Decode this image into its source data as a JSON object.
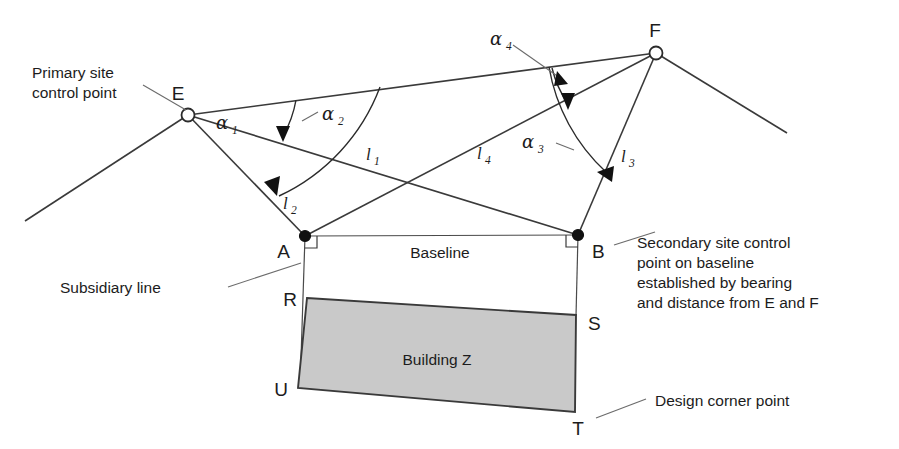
{
  "figure": {
    "colors": {
      "line": "#3a3a3a",
      "building_fill": "#c9c9c9",
      "building_stroke": "#3a3a3a",
      "text": "#1c1c1c",
      "background": "#ffffff"
    }
  },
  "annotations": {
    "primary_control": {
      "line1": "Primary site",
      "line2": "control point"
    },
    "secondary_control": {
      "line1": "Secondary site control",
      "line2": "point on baseline",
      "line3": "established by bearing",
      "line4": "and distance from E and F"
    },
    "subsidiary_line": "Subsidiary line",
    "design_corner": "Design corner point",
    "baseline": "Baseline",
    "building": "Building Z"
  },
  "points": {
    "E": {
      "label": "E",
      "x": 188,
      "y": 115,
      "type": "primary-control-point"
    },
    "F": {
      "label": "F",
      "x": 656,
      "y": 53,
      "type": "primary-control-point"
    },
    "A": {
      "label": "A",
      "x": 305,
      "y": 236,
      "type": "secondary-control-point"
    },
    "B": {
      "label": "B",
      "x": 578,
      "y": 235,
      "type": "secondary-control-point"
    },
    "R": {
      "label": "R",
      "x": 307,
      "y": 298,
      "type": "design-corner-point"
    },
    "S": {
      "label": "S",
      "x": 576,
      "y": 315,
      "type": "design-corner-point"
    },
    "T": {
      "label": "T",
      "x": 575,
      "y": 412,
      "type": "design-corner-point"
    },
    "U": {
      "label": "U",
      "x": 298,
      "y": 388,
      "type": "design-corner-point"
    }
  },
  "angles": {
    "a1": {
      "label": "α",
      "sub": "1",
      "at": "E",
      "from": "E-F",
      "to": "l1"
    },
    "a2": {
      "label": "α",
      "sub": "2",
      "at": "E",
      "from": "E-F",
      "to": "l2"
    },
    "a3": {
      "label": "α",
      "sub": "3",
      "at": "F",
      "from": "F-E",
      "to": "l3"
    },
    "a4": {
      "label": "α",
      "sub": "4",
      "at": "F",
      "from": "F-E",
      "to": "l4"
    }
  },
  "distances": {
    "l1": {
      "label": "l",
      "sub": "1",
      "from": "E",
      "to": "B"
    },
    "l2": {
      "label": "l",
      "sub": "2",
      "from": "E",
      "to": "A"
    },
    "l3": {
      "label": "l",
      "sub": "3",
      "from": "F",
      "to": "B"
    },
    "l4": {
      "label": "l",
      "sub": "4",
      "from": "F",
      "to": "A"
    }
  }
}
